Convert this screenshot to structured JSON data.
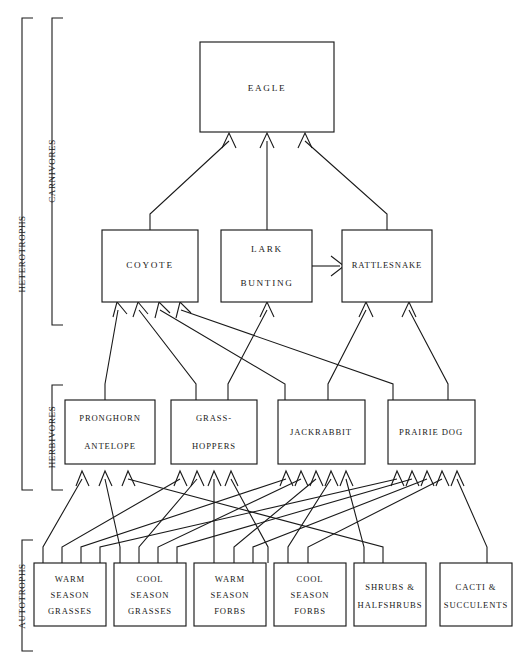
{
  "diagram": {
    "type": "food-web",
    "trophic_groups": [
      {
        "id": "heterotrophs",
        "label": "HETEROTROPHS",
        "level": "outer"
      },
      {
        "id": "carnivores",
        "label": "CARNIVORES",
        "level": "inner"
      },
      {
        "id": "herbivores",
        "label": "HERBIVORES",
        "level": "inner"
      },
      {
        "id": "autotrophs",
        "label": "AUTOTROPHS",
        "level": "outer"
      }
    ],
    "tertiary_consumers": [
      {
        "id": "eagle",
        "label": "EAGLE"
      }
    ],
    "carnivores": [
      {
        "id": "coyote",
        "label": "COYOTE"
      },
      {
        "id": "lark_bunting",
        "label": "LARK",
        "label2": "BUNTING"
      },
      {
        "id": "rattlesnake",
        "label": "RATTLESNAKE"
      }
    ],
    "herbivores": [
      {
        "id": "pronghorn",
        "label": "PRONGHORN",
        "label2": "ANTELOPE"
      },
      {
        "id": "grasshoppers",
        "label": "GRASS-",
        "label2": "HOPPERS"
      },
      {
        "id": "jackrabbit",
        "label": "JACKRABBIT"
      },
      {
        "id": "prairie_dog",
        "label": "PRAIRIE DOG"
      }
    ],
    "producers": [
      {
        "id": "warm_grasses",
        "line1": "WARM",
        "line2": "SEASON",
        "line3": "GRASSES"
      },
      {
        "id": "cool_grasses",
        "line1": "COOL",
        "line2": "SEASON",
        "line3": "GRASSES"
      },
      {
        "id": "warm_forbs",
        "line1": "WARM",
        "line2": "SEASON",
        "line3": "FORBS"
      },
      {
        "id": "cool_forbs",
        "line1": "COOL",
        "line2": "SEASON",
        "line3": "FORBS"
      },
      {
        "id": "shrubs",
        "line1": "SHRUBS &",
        "line2": "HALFSHRUBS",
        "line3": ""
      },
      {
        "id": "cacti",
        "line1": "CACTI &",
        "line2": "SUCCULENTS",
        "line3": ""
      }
    ],
    "edges": [
      {
        "from": "coyote",
        "to": "eagle"
      },
      {
        "from": "lark_bunting",
        "to": "eagle"
      },
      {
        "from": "rattlesnake",
        "to": "eagle"
      },
      {
        "from": "lark_bunting",
        "to": "rattlesnake"
      },
      {
        "from": "pronghorn",
        "to": "coyote"
      },
      {
        "from": "grasshoppers",
        "to": "coyote"
      },
      {
        "from": "jackrabbit",
        "to": "coyote"
      },
      {
        "from": "prairie_dog",
        "to": "coyote"
      },
      {
        "from": "grasshoppers",
        "to": "lark_bunting"
      },
      {
        "from": "jackrabbit",
        "to": "rattlesnake"
      },
      {
        "from": "prairie_dog",
        "to": "rattlesnake"
      },
      {
        "from": "warm_grasses",
        "to": "pronghorn"
      },
      {
        "from": "cool_grasses",
        "to": "pronghorn"
      },
      {
        "from": "shrubs",
        "to": "pronghorn"
      },
      {
        "from": "warm_grasses",
        "to": "grasshoppers"
      },
      {
        "from": "cool_grasses",
        "to": "grasshoppers"
      },
      {
        "from": "warm_forbs",
        "to": "grasshoppers"
      },
      {
        "from": "cool_forbs",
        "to": "grasshoppers"
      },
      {
        "from": "warm_grasses",
        "to": "jackrabbit"
      },
      {
        "from": "cool_grasses",
        "to": "jackrabbit"
      },
      {
        "from": "warm_forbs",
        "to": "jackrabbit"
      },
      {
        "from": "cool_forbs",
        "to": "jackrabbit"
      },
      {
        "from": "shrubs",
        "to": "jackrabbit"
      },
      {
        "from": "warm_grasses",
        "to": "prairie_dog"
      },
      {
        "from": "cool_grasses",
        "to": "prairie_dog"
      },
      {
        "from": "warm_forbs",
        "to": "prairie_dog"
      },
      {
        "from": "cool_forbs",
        "to": "prairie_dog"
      },
      {
        "from": "cacti",
        "to": "prairie_dog"
      }
    ],
    "colors": {
      "line": "#1a1a1a",
      "box_fill": "#ffffff",
      "background": "#ffffff"
    }
  }
}
